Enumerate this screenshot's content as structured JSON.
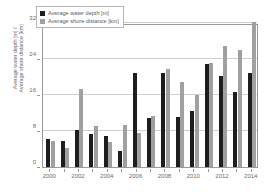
{
  "chart_data": {
    "type": "bar",
    "title": "",
    "xlabel": "",
    "ylabel": "Average water depth [m] / Average shore distance [km]",
    "ylabel_line1": "Average water depth [m] /",
    "ylabel_line2": "Average shore distance [km]",
    "ylim": [
      0,
      32
    ],
    "yticks": [
      0,
      8,
      16,
      24,
      32
    ],
    "ytick_labels": [
      "0",
      "8",
      "16",
      "24",
      "32"
    ],
    "grid": true,
    "legend_position": "top-left",
    "categories": [
      "2000",
      "2001",
      "2002",
      "2003",
      "2004",
      "2005",
      "2006",
      "2007",
      "2008",
      "2009",
      "2010",
      "2011",
      "2012",
      "2013",
      "2014"
    ],
    "xtick_labels": [
      "2000",
      "2002",
      "2004",
      "2006",
      "2008",
      "2010",
      "2012",
      "2014"
    ],
    "series": [
      {
        "name": "Average water depth [m]",
        "color": "#1d1d1d",
        "values": [
          6.2,
          5.8,
          8.3,
          7.3,
          7.0,
          3.6,
          21.0,
          11.0,
          21.0,
          11.2,
          12.4,
          22.8,
          20.2,
          16.6,
          21.0
        ]
      },
      {
        "name": "Average shore distance [km]",
        "color": "#a0a0a0",
        "values": [
          5.8,
          4.2,
          17.3,
          9.1,
          5.6,
          9.4,
          7.6,
          11.4,
          21.8,
          18.9,
          16.0,
          23.2,
          27.0,
          26.0,
          32.2
        ]
      }
    ]
  },
  "legend": {
    "items": [
      {
        "label": "Average water depth [m]"
      },
      {
        "label": "Average shore distance [km]"
      }
    ]
  }
}
